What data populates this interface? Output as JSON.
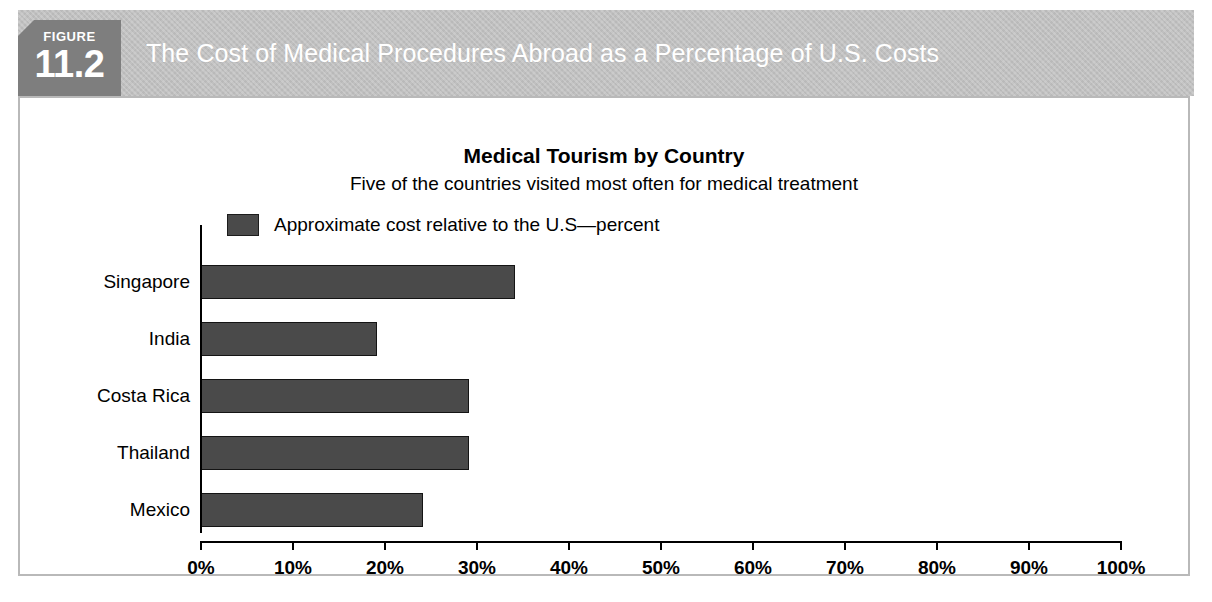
{
  "figure": {
    "tab_label": "FIGURE",
    "tab_number": "11.2",
    "banner_title": "The Cost of Medical Procedures Abroad as a Percentage of U.S. Costs"
  },
  "colors": {
    "banner_bg": "#c0c0c0",
    "tab_bg": "#7e7e7e",
    "bar_fill": "#4a4a4a",
    "panel_border": "#b9b9b9"
  },
  "chart_data": {
    "type": "bar",
    "orientation": "horizontal",
    "title": "Medical Tourism by Country",
    "subtitle": "Five of the countries visited most often for medical treatment",
    "categories": [
      "Singapore",
      "India",
      "Costa Rica",
      "Thailand",
      "Mexico"
    ],
    "values": [
      34,
      19,
      29,
      29,
      24
    ],
    "series": [
      {
        "name": "Approximate cost relative to the U.S—percent",
        "values": [
          34,
          19,
          29,
          29,
          24
        ]
      }
    ],
    "legend": [
      "Approximate cost relative to the U.S—percent"
    ],
    "legend_position": "top-left",
    "xlabel": "",
    "ylabel": "",
    "xlim": [
      0,
      100
    ],
    "xtick_labels": [
      "0%",
      "10%",
      "20%",
      "30%",
      "40%",
      "50%",
      "60%",
      "70%",
      "80%",
      "90%",
      "100%"
    ],
    "xticks": [
      0,
      10,
      20,
      30,
      40,
      50,
      60,
      70,
      80,
      90,
      100
    ],
    "grid": false
  }
}
